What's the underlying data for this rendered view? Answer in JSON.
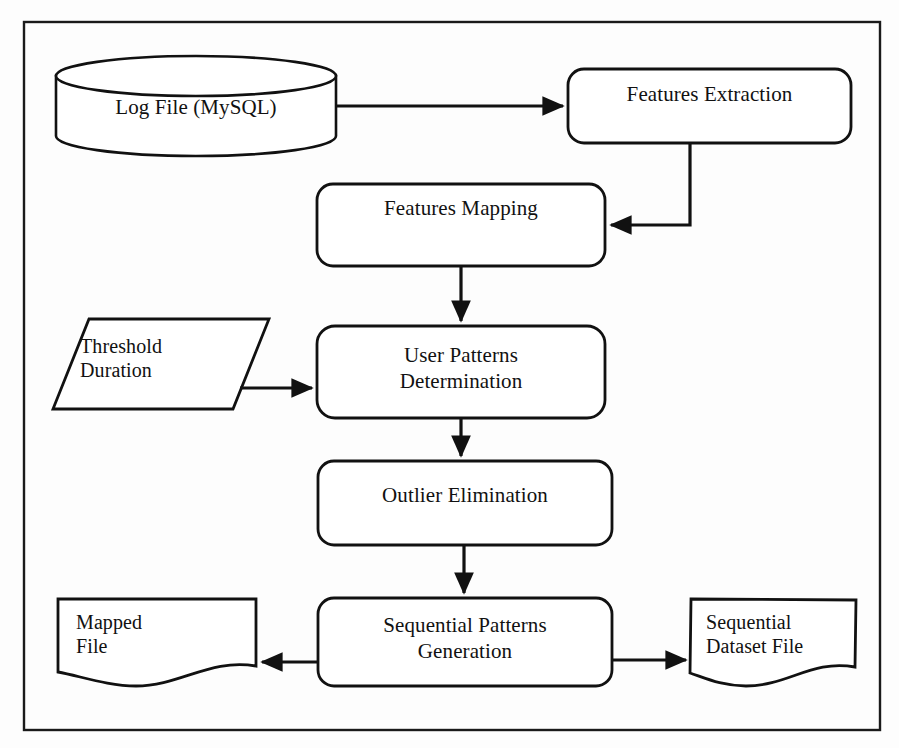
{
  "diagram": {
    "frame": {
      "stroke": "#1a1a1a"
    },
    "colors": {
      "stroke": "#111111",
      "background": "#fdfdfd",
      "text": "#111111"
    },
    "nodes": [
      {
        "id": "log-file",
        "shape": "cylinder",
        "label": "Log File (MySQL)"
      },
      {
        "id": "features-extraction",
        "shape": "rounded-rect",
        "label": "Features Extraction"
      },
      {
        "id": "features-mapping",
        "shape": "rounded-rect",
        "label": "Features Mapping"
      },
      {
        "id": "threshold-duration",
        "shape": "parallelogram",
        "label": "Threshold\nDuration"
      },
      {
        "id": "user-patterns",
        "shape": "rounded-rect",
        "label": "User Patterns\nDetermination"
      },
      {
        "id": "outlier-elimination",
        "shape": "rounded-rect",
        "label": "Outlier Elimination"
      },
      {
        "id": "sequential-patterns",
        "shape": "rounded-rect",
        "label": "Sequential Patterns\nGeneration"
      },
      {
        "id": "mapped-file",
        "shape": "document",
        "label": "Mapped\nFile"
      },
      {
        "id": "sequential-dataset",
        "shape": "document",
        "label": "Sequential\nDataset File"
      }
    ],
    "edges": [
      {
        "from": "log-file",
        "to": "features-extraction",
        "style": "straight-right"
      },
      {
        "from": "features-extraction",
        "to": "features-mapping",
        "style": "elbow-down-left"
      },
      {
        "from": "features-mapping",
        "to": "user-patterns",
        "style": "straight-down"
      },
      {
        "from": "threshold-duration",
        "to": "user-patterns",
        "style": "straight-right"
      },
      {
        "from": "user-patterns",
        "to": "outlier-elimination",
        "style": "straight-down"
      },
      {
        "from": "outlier-elimination",
        "to": "sequential-patterns",
        "style": "straight-down"
      },
      {
        "from": "sequential-patterns",
        "to": "mapped-file",
        "style": "straight-left"
      },
      {
        "from": "sequential-patterns",
        "to": "sequential-dataset",
        "style": "straight-right"
      }
    ]
  }
}
